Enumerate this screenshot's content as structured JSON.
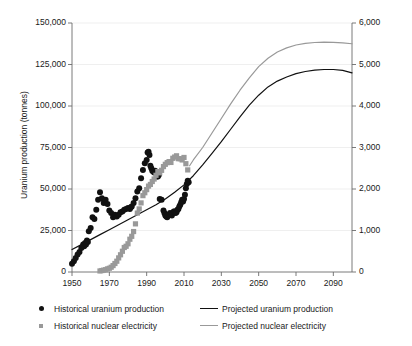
{
  "chart_data": {
    "type": "scatter",
    "title": "",
    "xlabel": "",
    "ylabel": "Uranium production (tonnes)",
    "y2label": "Nuclear electricity generation (terawatt-hours)",
    "xlim": [
      1950,
      2100
    ],
    "ylim": [
      0,
      150000
    ],
    "y2lim": [
      0,
      6000
    ],
    "grid": true,
    "legend_position": "below-plot",
    "x_ticks": [
      "1950",
      "1970",
      "1990",
      "2010",
      "2030",
      "2050",
      "2070",
      "2090"
    ],
    "x_tick_values": [
      1950,
      1970,
      1990,
      2010,
      2030,
      2050,
      2070,
      2090
    ],
    "y_ticks": [
      "0",
      "25,000",
      "50,000",
      "75,000",
      "100,000",
      "125,000",
      "150,000"
    ],
    "y_tick_values": [
      0,
      25000,
      50000,
      75000,
      100000,
      125000,
      150000
    ],
    "y2_ticks": [
      "0",
      "1,000",
      "2,000",
      "3,000",
      "4,000",
      "5,000",
      "6,000"
    ],
    "y2_tick_values": [
      0,
      1000,
      2000,
      3000,
      4000,
      5000,
      6000
    ],
    "series": [
      {
        "name": "Historical uranium production",
        "type": "scatter",
        "axis": "left",
        "color": "#111111",
        "marker": "circle",
        "marker_size": 4.2,
        "points": [
          [
            1950,
            5000
          ],
          [
            1951,
            6500
          ],
          [
            1952,
            8500
          ],
          [
            1953,
            10500
          ],
          [
            1954,
            12000
          ],
          [
            1955,
            14500
          ],
          [
            1956,
            16500
          ],
          [
            1956.5,
            15500
          ],
          [
            1957,
            17500
          ],
          [
            1957.5,
            16500
          ],
          [
            1958,
            19000
          ],
          [
            1958.5,
            18000
          ],
          [
            1959,
            24500
          ],
          [
            1960,
            26500
          ],
          [
            1961,
            33000
          ],
          [
            1962,
            32000
          ],
          [
            1963,
            37500
          ],
          [
            1964,
            43500
          ],
          [
            1965,
            48000
          ],
          [
            1966,
            44500
          ],
          [
            1967,
            41500
          ],
          [
            1968,
            43500
          ],
          [
            1969,
            41000
          ],
          [
            1970,
            37000
          ],
          [
            1971,
            35500
          ],
          [
            1972,
            33000
          ],
          [
            1973,
            34500
          ],
          [
            1974,
            33500
          ],
          [
            1975,
            34500
          ],
          [
            1976,
            36000
          ],
          [
            1977,
            36500
          ],
          [
            1978,
            37500
          ],
          [
            1979,
            38000
          ],
          [
            1980,
            38500
          ],
          [
            1981,
            38000
          ],
          [
            1981.5,
            39000
          ],
          [
            1982,
            39500
          ],
          [
            1983,
            41500
          ],
          [
            1984,
            44500
          ],
          [
            1985,
            48500
          ],
          [
            1986,
            50500
          ],
          [
            1987,
            56500
          ],
          [
            1988,
            61500
          ],
          [
            1989,
            65500
          ],
          [
            1990,
            67500
          ],
          [
            1990.5,
            72000
          ],
          [
            1991,
            72500
          ],
          [
            1991.5,
            70500
          ],
          [
            1992,
            64000
          ],
          [
            1992.5,
            62500
          ],
          [
            1993,
            61000
          ],
          [
            1993.5,
            60500
          ],
          [
            1994,
            60000
          ],
          [
            1994.5,
            61000
          ],
          [
            1995,
            60000
          ],
          [
            1995.5,
            57500
          ],
          [
            1996,
            57500
          ],
          [
            1996.5,
            58500
          ],
          [
            1997,
            44000
          ],
          [
            1998,
            43500
          ],
          [
            1999,
            37000
          ],
          [
            1999.5,
            35500
          ],
          [
            2000,
            34000
          ],
          [
            2000.5,
            33500
          ],
          [
            2001,
            33000
          ],
          [
            2001.5,
            34000
          ],
          [
            2002,
            34500
          ],
          [
            2002.5,
            35500
          ],
          [
            2003,
            35000
          ],
          [
            2003.5,
            34000
          ],
          [
            2004,
            35500
          ],
          [
            2004.5,
            36500
          ],
          [
            2005,
            36500
          ],
          [
            2005.5,
            35500
          ],
          [
            2006,
            36000
          ],
          [
            2006.5,
            37500
          ],
          [
            2007,
            38000
          ],
          [
            2007.5,
            39500
          ],
          [
            2008,
            40500
          ],
          [
            2008.5,
            42000
          ],
          [
            2009,
            43500
          ],
          [
            2009.5,
            42500
          ],
          [
            2010,
            44000
          ],
          [
            2010.5,
            46500
          ],
          [
            2011,
            50500
          ],
          [
            2011.5,
            53000
          ],
          [
            2012,
            55000
          ],
          [
            2012.5,
            54000
          ]
        ]
      },
      {
        "name": "Historical nuclear electricity",
        "type": "scatter",
        "axis": "right",
        "color": "#999999",
        "marker": "square",
        "marker_size": 3.4,
        "points": [
          [
            1965,
            25
          ],
          [
            1966,
            35
          ],
          [
            1967,
            45
          ],
          [
            1968,
            55
          ],
          [
            1969,
            75
          ],
          [
            1970,
            90
          ],
          [
            1971,
            115
          ],
          [
            1972,
            155
          ],
          [
            1973,
            205
          ],
          [
            1974,
            260
          ],
          [
            1975,
            340
          ],
          [
            1976,
            415
          ],
          [
            1977,
            500
          ],
          [
            1978,
            590
          ],
          [
            1979,
            620
          ],
          [
            1980,
            680
          ],
          [
            1981,
            790
          ],
          [
            1982,
            860
          ],
          [
            1983,
            975
          ],
          [
            1984,
            1160
          ],
          [
            1985,
            1420
          ],
          [
            1986,
            1520
          ],
          [
            1987,
            1665
          ],
          [
            1988,
            1840
          ],
          [
            1989,
            1910
          ],
          [
            1990,
            1985
          ],
          [
            1991,
            2070
          ],
          [
            1992,
            2110
          ],
          [
            1993,
            2180
          ],
          [
            1994,
            2240
          ],
          [
            1995,
            2330
          ],
          [
            1996,
            2420
          ],
          [
            1997,
            2390
          ],
          [
            1998,
            2450
          ],
          [
            1999,
            2540
          ],
          [
            2000,
            2595
          ],
          [
            2001,
            2635
          ],
          [
            2002,
            2660
          ],
          [
            2003,
            2640
          ],
          [
            2004,
            2740
          ],
          [
            2005,
            2770
          ],
          [
            2006,
            2800
          ],
          [
            2007,
            2730
          ],
          [
            2008,
            2730
          ],
          [
            2009,
            2700
          ],
          [
            2010,
            2760
          ],
          [
            2011,
            2610
          ],
          [
            2012,
            2460
          ]
        ]
      },
      {
        "name": "Projected uranium production",
        "type": "line",
        "axis": "left",
        "color": "#111111",
        "line_width": 1.2,
        "points": [
          [
            1950,
            13500
          ],
          [
            1955,
            16500
          ],
          [
            1960,
            19500
          ],
          [
            1965,
            22500
          ],
          [
            1970,
            25500
          ],
          [
            1975,
            28500
          ],
          [
            1980,
            31500
          ],
          [
            1985,
            34500
          ],
          [
            1990,
            37500
          ],
          [
            1995,
            40500
          ],
          [
            2000,
            44000
          ],
          [
            2005,
            48000
          ],
          [
            2010,
            52500
          ],
          [
            2015,
            58000
          ],
          [
            2020,
            64500
          ],
          [
            2025,
            71500
          ],
          [
            2030,
            78500
          ],
          [
            2035,
            86000
          ],
          [
            2040,
            93500
          ],
          [
            2045,
            100500
          ],
          [
            2050,
            106500
          ],
          [
            2055,
            111500
          ],
          [
            2060,
            115000
          ],
          [
            2065,
            117500
          ],
          [
            2070,
            119500
          ],
          [
            2075,
            120800
          ],
          [
            2080,
            121600
          ],
          [
            2085,
            122000
          ],
          [
            2090,
            122000
          ],
          [
            2095,
            121500
          ],
          [
            2100,
            120000
          ]
        ]
      },
      {
        "name": "Projected nuclear electricity",
        "type": "line",
        "axis": "right",
        "color": "#999999",
        "line_width": 1.2,
        "points": [
          [
            2013,
            2560
          ],
          [
            2015,
            2700
          ],
          [
            2020,
            3000
          ],
          [
            2025,
            3350
          ],
          [
            2030,
            3700
          ],
          [
            2035,
            4050
          ],
          [
            2040,
            4380
          ],
          [
            2045,
            4680
          ],
          [
            2050,
            4950
          ],
          [
            2055,
            5150
          ],
          [
            2060,
            5300
          ],
          [
            2065,
            5400
          ],
          [
            2070,
            5470
          ],
          [
            2075,
            5510
          ],
          [
            2080,
            5530
          ],
          [
            2085,
            5540
          ],
          [
            2090,
            5535
          ],
          [
            2095,
            5520
          ],
          [
            2100,
            5500
          ]
        ]
      }
    ]
  },
  "axes": {
    "left_title": "Uranium production (tonnes)",
    "right_title": "Nuclear electricity generation (terawatt-hours)"
  },
  "legend": {
    "items": [
      {
        "label": "Historical uranium production",
        "marker": "dot",
        "color": "#111111"
      },
      {
        "label": "Projected uranium production",
        "marker": "line",
        "color": "#111111"
      },
      {
        "label": "Historical nuclear electricity",
        "marker": "square-dot",
        "color": "#999999"
      },
      {
        "label": "Projected nuclear electricity",
        "marker": "line",
        "color": "#999999"
      }
    ]
  }
}
